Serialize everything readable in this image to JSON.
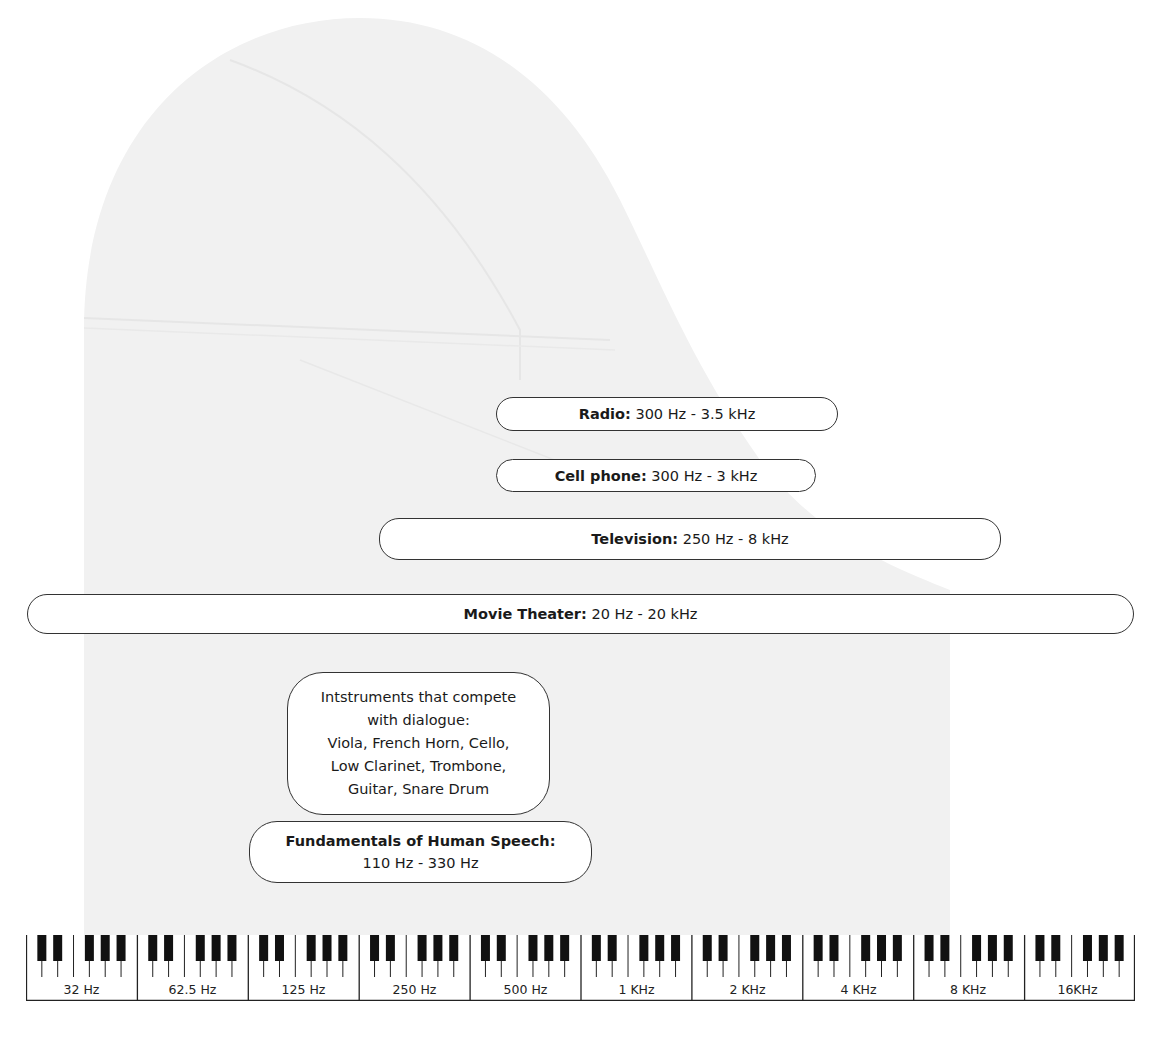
{
  "diagram": {
    "ranges": [
      {
        "name": "Radio",
        "range": "300 Hz - 3.5 kHz"
      },
      {
        "name": "Cell phone",
        "range": "300 Hz - 3 kHz"
      },
      {
        "name": "Television",
        "range": "250 Hz - 8 kHz"
      },
      {
        "name": "Movie Theater",
        "range": "20 Hz - 20 kHz"
      }
    ],
    "instruments_box": {
      "lines": [
        "Intstruments that compete",
        "with dialogue:",
        "Viola, French Horn, Cello,",
        "Low Clarinet, Trombone,",
        "Guitar, Snare Drum"
      ]
    },
    "speech_box": {
      "title": "Fundamentals of Human Speech:",
      "range": "110 Hz - 330 Hz"
    },
    "keyboard": {
      "octave_labels": [
        "32 Hz",
        "62.5 Hz",
        "125 Hz",
        "250 Hz",
        "500 Hz",
        "1 KHz",
        "2 KHz",
        "4 KHz",
        "8 KHz",
        "16KHz"
      ]
    },
    "colors": {
      "background_piano": "#f2f2f2",
      "pill_border": "#333333",
      "key_black": "#111111"
    }
  }
}
